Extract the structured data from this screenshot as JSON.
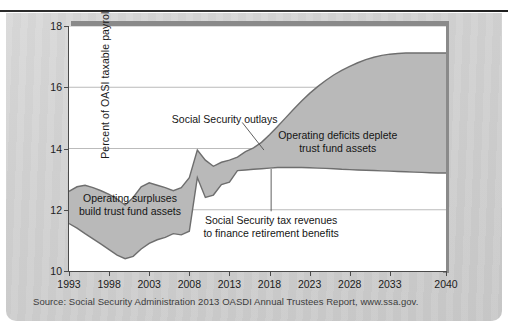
{
  "figure": {
    "source_note": "Source: Social Security Administration 2013 OASDI Annual Trustees Report, www.ssa.gov."
  },
  "chart_data": {
    "type": "area",
    "title": "",
    "xlabel": "",
    "ylabel": "Percent of OASI taxable payroll",
    "xlim": [
      1993,
      2040
    ],
    "ylim": [
      10,
      18
    ],
    "yticks": [
      10,
      12,
      14,
      16,
      18
    ],
    "ytick_labels": [
      "10",
      "12",
      "14",
      "16",
      "18"
    ],
    "xticks": [
      1993,
      1998,
      2003,
      2008,
      2013,
      2018,
      2023,
      2028,
      2033,
      2040
    ],
    "xtick_labels": [
      "1993",
      "1998",
      "2003",
      "2008",
      "2013",
      "2018",
      "2023",
      "2028",
      "2033",
      "2040"
    ],
    "grid": true,
    "grid_axis": "y",
    "legend_position": "none",
    "fill_color": "#b9b9b9",
    "line_color": "#6e6e6e",
    "annotations": [
      {
        "name": "outlays-label",
        "text": "Social Security outlays",
        "x": 2012.4,
        "y": 14.95,
        "leader": true
      },
      {
        "name": "deficits-label",
        "line1": "Operating deficits deplete",
        "line2": "trust fund assets",
        "x": 2026.5,
        "y": 14.2,
        "leader": false
      },
      {
        "name": "surpluses-label",
        "line1": "Operating surpluses",
        "line2": "build trust fund assets",
        "x": 2000.6,
        "y": 12.15,
        "leader": false
      },
      {
        "name": "tax-revenues-label",
        "line1": "Social Security tax revenues",
        "line2": "to finance retirement benefits",
        "x": 2018.2,
        "y": 11.45,
        "leader": true
      }
    ],
    "series": [
      {
        "name": "Social Security outlays",
        "x": [
          1993,
          1994,
          1995,
          1996,
          1997,
          1998,
          1999,
          2000,
          2001,
          2002,
          2003,
          2004,
          2005,
          2006,
          2007,
          2008,
          2009,
          2010,
          2011,
          2012,
          2013,
          2014,
          2015,
          2016,
          2017,
          2018,
          2019,
          2020,
          2021,
          2022,
          2023,
          2024,
          2025,
          2026,
          2027,
          2028,
          2029,
          2030,
          2031,
          2032,
          2033,
          2034,
          2035,
          2036,
          2037,
          2038,
          2039,
          2040
        ],
        "values": [
          12.6,
          12.75,
          12.8,
          12.72,
          12.62,
          12.5,
          12.35,
          12.15,
          12.4,
          12.75,
          12.88,
          12.8,
          12.72,
          12.62,
          12.72,
          13.05,
          13.95,
          13.62,
          13.42,
          13.55,
          13.62,
          13.72,
          13.9,
          14.02,
          14.2,
          14.45,
          14.72,
          15.0,
          15.28,
          15.55,
          15.8,
          16.02,
          16.22,
          16.4,
          16.55,
          16.68,
          16.8,
          16.9,
          16.98,
          17.04,
          17.08,
          17.1,
          17.12,
          17.12,
          17.12,
          17.12,
          17.12,
          17.12
        ]
      },
      {
        "name": "Social Security tax revenues",
        "x": [
          1993,
          1994,
          1995,
          1996,
          1997,
          1998,
          1999,
          2000,
          2001,
          2002,
          2003,
          2004,
          2005,
          2006,
          2007,
          2008,
          2009,
          2010,
          2011,
          2012,
          2013,
          2014,
          2015,
          2016,
          2017,
          2018,
          2019,
          2020,
          2021,
          2022,
          2023,
          2024,
          2025,
          2026,
          2027,
          2028,
          2029,
          2030,
          2031,
          2032,
          2033,
          2034,
          2035,
          2036,
          2037,
          2038,
          2039,
          2040
        ],
        "values": [
          11.55,
          11.4,
          11.22,
          11.05,
          10.88,
          10.7,
          10.52,
          10.4,
          10.48,
          10.72,
          10.9,
          11.02,
          11.1,
          11.22,
          11.18,
          11.3,
          13.05,
          12.4,
          12.48,
          12.82,
          12.9,
          13.28,
          13.3,
          13.32,
          13.34,
          13.36,
          13.38,
          13.38,
          13.38,
          13.38,
          13.37,
          13.36,
          13.35,
          13.34,
          13.32,
          13.31,
          13.3,
          13.29,
          13.28,
          13.27,
          13.26,
          13.25,
          13.24,
          13.23,
          13.22,
          13.21,
          13.2,
          13.2
        ]
      }
    ]
  }
}
